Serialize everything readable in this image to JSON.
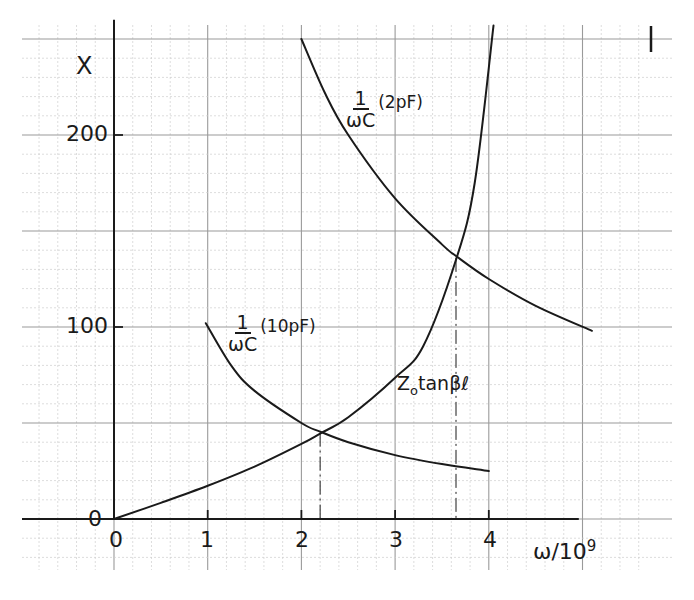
{
  "chart_data": {
    "type": "line",
    "title": "",
    "xlabel": "ω/10⁹",
    "ylabel": "X",
    "xlim": [
      0,
      5.2
    ],
    "ylim": [
      0,
      260
    ],
    "x_ticks": [
      "0",
      "1",
      "2",
      "3",
      "4"
    ],
    "y_ticks": [
      "0",
      "100",
      "200"
    ],
    "grid": true,
    "legend": "inline labels",
    "series": [
      {
        "name": "Z0 tanβℓ",
        "label_main": "Z",
        "label_sub": "o",
        "label_rest": "tanβℓ",
        "x": [
          0,
          0.5,
          1.0,
          1.5,
          2.0,
          2.2,
          2.5,
          3.0,
          3.3,
          3.65,
          3.85,
          4.05
        ],
        "values": [
          0,
          8.4,
          17.3,
          27.3,
          39.1,
          44.5,
          53.0,
          73.6,
          90.0,
          135,
          175,
          257
        ]
      },
      {
        "name": "1/ωC (10pF)",
        "label_num": "1",
        "label_den": "ωC",
        "label_unit": "(10pF)",
        "x": [
          0.98,
          1.25,
          1.5,
          2.0,
          2.2,
          2.5,
          3.0,
          3.5,
          4.0
        ],
        "values": [
          102,
          80,
          66.7,
          50,
          45.5,
          40,
          33.3,
          28.6,
          25
        ]
      },
      {
        "name": "1/ωC (2pF)",
        "label_num": "1",
        "label_den": "ωC",
        "label_unit": "(2pF)",
        "x": [
          2.0,
          2.25,
          2.5,
          3.0,
          3.5,
          3.65,
          4.0,
          4.5,
          5.1
        ],
        "values": [
          250,
          222,
          200,
          167,
          143,
          137,
          125,
          111,
          98
        ]
      }
    ],
    "annotations": [
      {
        "type": "vertical-dashed",
        "x": 2.2,
        "y": 45,
        "note": "intersection of Z0 tanβℓ and 1/ωC (10pF)"
      },
      {
        "type": "vertical-dashed",
        "x": 3.65,
        "y": 136,
        "note": "intersection of Z0 tanβℓ and 1/ωC (2pF)"
      }
    ]
  },
  "axes": {
    "y_label": "X",
    "x_label_main": "ω/10",
    "x_label_exp": "9",
    "origin_y_label": "0",
    "x_ticks": [
      {
        "label": "0",
        "value": 0
      },
      {
        "label": "1",
        "value": 1
      },
      {
        "label": "2",
        "value": 2
      },
      {
        "label": "3",
        "value": 3
      },
      {
        "label": "4",
        "value": 4
      }
    ],
    "y_ticks": [
      {
        "label": "100",
        "value": 100
      },
      {
        "label": "200",
        "value": 200
      }
    ]
  },
  "colors": {
    "ink": "#1a1a1a",
    "grid_major": "#9a9a9a",
    "grid_minor": "#cfcfcf",
    "paper": "#ffffff"
  }
}
